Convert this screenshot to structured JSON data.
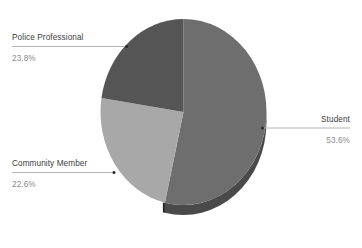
{
  "chart_data": {
    "type": "pie",
    "title": "",
    "subtitle": "",
    "xlabel": "",
    "ylabel": "",
    "legend_position": "callout-labels",
    "grid": false,
    "three_d": true,
    "categories": [
      "Student",
      "Police Professional",
      "Community Member"
    ],
    "values": [
      53.6,
      23.8,
      22.6
    ],
    "value_suffix": "%",
    "slices": [
      {
        "label": "Student",
        "value": 53.6,
        "value_text": "53.6%",
        "color": "#6e6e6e",
        "side_color": "#4a4a4a",
        "start_angle_deg": 0,
        "end_angle_deg": 192.96,
        "callout_side": "right"
      },
      {
        "label": "Police Professional",
        "value": 23.8,
        "value_text": "23.8%",
        "color": "#a8a8a8",
        "side_color": "#7d7d7d",
        "start_angle_deg": 273.24,
        "end_angle_deg": 360,
        "callout_side": "left"
      },
      {
        "label": "Community Member",
        "value": 22.6,
        "value_text": "22.6%",
        "color": "#555555",
        "side_color": "#2a2a2a",
        "start_angle_deg": 192.96,
        "end_angle_deg": 274.32,
        "callout_side": "left"
      }
    ]
  },
  "callouts": {
    "police_professional": {
      "label": "Police Professional",
      "value_text": "23.8%"
    },
    "community_member": {
      "label": "Community Member",
      "value_text": "22.6%"
    },
    "student": {
      "label": "Student",
      "value_text": "53.6%"
    }
  },
  "colors": {
    "student_top": "#6e6e6e",
    "student_side": "#4a4a4a",
    "police_top": "#a8a8a8",
    "police_side": "#7d7d7d",
    "community_top": "#555555",
    "community_side": "#2a2a2a",
    "leader": "#b4b4b4",
    "label": "#3c3c3c",
    "value": "#8a8a8a",
    "background": "#ffffff"
  }
}
